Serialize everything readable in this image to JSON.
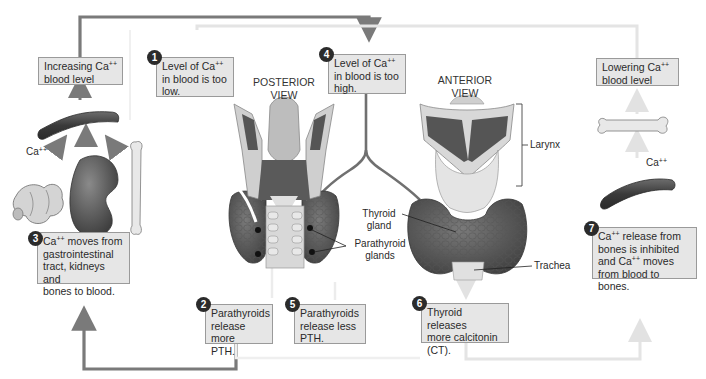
{
  "figure": {
    "topic": "Calcium homeostasis regulated by parathyroid hormone and calcitonin",
    "views": {
      "posterior": "POSTERIOR\nVIEW",
      "anterior": "ANTERIOR\nVIEW"
    },
    "anatomy_labels": {
      "larynx": "Larynx",
      "thyroid_gland_1": "Thyroid",
      "thyroid_gland_2": "gland",
      "parathyroid_1": "Parathyroid",
      "parathyroid_2": "glands",
      "trachea": "Trachea"
    },
    "ion_labels": {
      "left_ca": "Ca",
      "right_ca": "Ca",
      "charge": "++"
    },
    "result_boxes": {
      "increasing": {
        "line1": "Increasing Ca",
        "sup": "++",
        "line2": "blood level"
      },
      "lowering": {
        "line1": "Lowering Ca",
        "sup": "++",
        "line2": "blood level"
      }
    },
    "steps": [
      {
        "number": "1",
        "line1": "Level of Ca",
        "sup": "++",
        "line2": "in blood is too",
        "line3": "low."
      },
      {
        "number": "2",
        "line1": "Parathyroids",
        "line2": "release more",
        "line3": "PTH."
      },
      {
        "number": "3",
        "line1_sup": "++",
        "line1a": "Ca",
        "line1b": " moves from",
        "line2": "gastrointestinal",
        "line3": "tract, kidneys and",
        "line4": "bones to blood."
      },
      {
        "number": "4",
        "line1": "Level of Ca",
        "sup": "++",
        "line2": "in blood is too",
        "line3": "high."
      },
      {
        "number": "5",
        "line1": "Parathyroids",
        "line2": "release less",
        "line3": "PTH."
      },
      {
        "number": "6",
        "line1": "Thyroid releases",
        "line2": "more calcitonin",
        "line3": "(CT)."
      },
      {
        "number": "7",
        "line1a": "Ca",
        "line1_sup": "++",
        "line1b": " release from",
        "line2": "bones is inhibited",
        "line3a": "and Ca",
        "line3_sup": "++",
        "line3b": " moves",
        "line4": "from blood to bones."
      }
    ],
    "colors": {
      "pathway_dark": "#7a7a7a",
      "pathway_light": "#e4e4e4",
      "box_fill": "#e6e6e6",
      "box_border": "#9a9a9a",
      "step_badge": "#2b2b2b",
      "tissue_dark": "#4a4a4a",
      "tissue_mid": "#6a6a6a",
      "cartilage": "#d6d6d6"
    }
  }
}
